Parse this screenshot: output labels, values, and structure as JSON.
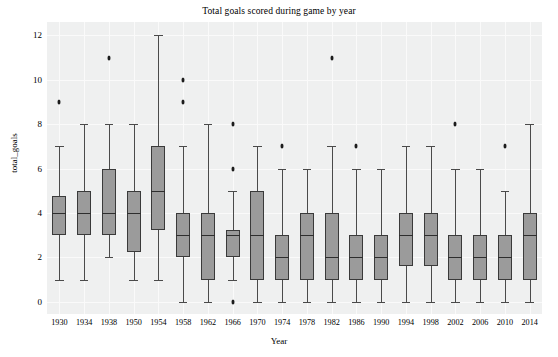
{
  "chart_data": {
    "type": "box",
    "title": "Total goals scored during game by year",
    "xlabel": "Year",
    "ylabel": "total_goals",
    "ylim": [
      -0.55,
      12.6
    ],
    "yticks": [
      0,
      2,
      4,
      6,
      8,
      10,
      12
    ],
    "grid": true,
    "legend": "none",
    "categories": [
      "1930",
      "1934",
      "1938",
      "1950",
      "1954",
      "1958",
      "1962",
      "1966",
      "1970",
      "1974",
      "1978",
      "1982",
      "1986",
      "1990",
      "1994",
      "1998",
      "2002",
      "2006",
      "2010",
      "2014"
    ],
    "boxes": [
      {
        "category": "1930",
        "whisker_low": 1,
        "q1": 3,
        "median": 4,
        "q3": 4.75,
        "whisker_high": 7,
        "outliers": [
          9
        ]
      },
      {
        "category": "1934",
        "whisker_low": 1,
        "q1": 3,
        "median": 4,
        "q3": 5,
        "whisker_high": 8,
        "outliers": []
      },
      {
        "category": "1938",
        "whisker_low": 2,
        "q1": 3,
        "median": 4,
        "q3": 6,
        "whisker_high": 8,
        "outliers": [
          11
        ]
      },
      {
        "category": "1950",
        "whisker_low": 1,
        "q1": 2.25,
        "median": 4,
        "q3": 5,
        "whisker_high": 8,
        "outliers": []
      },
      {
        "category": "1954",
        "whisker_low": 1,
        "q1": 3.25,
        "median": 5,
        "q3": 7,
        "whisker_high": 12,
        "outliers": []
      },
      {
        "category": "1958",
        "whisker_low": 0,
        "q1": 2,
        "median": 3,
        "q3": 4,
        "whisker_high": 7,
        "outliers": [
          9,
          10
        ]
      },
      {
        "category": "1962",
        "whisker_low": 0,
        "q1": 1,
        "median": 3,
        "q3": 4,
        "whisker_high": 8,
        "outliers": []
      },
      {
        "category": "1966",
        "whisker_low": 1,
        "q1": 2,
        "median": 3,
        "q3": 3.25,
        "whisker_high": 5,
        "outliers": [
          0,
          6,
          8
        ]
      },
      {
        "category": "1970",
        "whisker_low": 0,
        "q1": 1,
        "median": 3,
        "q3": 5,
        "whisker_high": 7,
        "outliers": []
      },
      {
        "category": "1974",
        "whisker_low": 0,
        "q1": 1,
        "median": 2,
        "q3": 3,
        "whisker_high": 6,
        "outliers": [
          7
        ]
      },
      {
        "category": "1978",
        "whisker_low": 0,
        "q1": 1,
        "median": 3,
        "q3": 4,
        "whisker_high": 6,
        "outliers": []
      },
      {
        "category": "1982",
        "whisker_low": 0,
        "q1": 1,
        "median": 2,
        "q3": 4,
        "whisker_high": 7,
        "outliers": [
          11
        ]
      },
      {
        "category": "1986",
        "whisker_low": 0,
        "q1": 1,
        "median": 2,
        "q3": 3,
        "whisker_high": 6,
        "outliers": [
          7
        ]
      },
      {
        "category": "1990",
        "whisker_low": 0,
        "q1": 1,
        "median": 2,
        "q3": 3,
        "whisker_high": 6,
        "outliers": []
      },
      {
        "category": "1994",
        "whisker_low": 0,
        "q1": 1.6,
        "median": 3,
        "q3": 4,
        "whisker_high": 7,
        "outliers": []
      },
      {
        "category": "1998",
        "whisker_low": 0,
        "q1": 1.6,
        "median": 3,
        "q3": 4,
        "whisker_high": 7,
        "outliers": []
      },
      {
        "category": "2002",
        "whisker_low": 0,
        "q1": 1,
        "median": 2,
        "q3": 3,
        "whisker_high": 6,
        "outliers": [
          8
        ]
      },
      {
        "category": "2006",
        "whisker_low": 0,
        "q1": 1,
        "median": 2,
        "q3": 3,
        "whisker_high": 6,
        "outliers": []
      },
      {
        "category": "2010",
        "whisker_low": 0,
        "q1": 1,
        "median": 2,
        "q3": 3,
        "whisker_high": 5,
        "outliers": [
          7
        ]
      },
      {
        "category": "2014",
        "whisker_low": 0,
        "q1": 1,
        "median": 3,
        "q3": 4,
        "whisker_high": 8,
        "outliers": []
      }
    ],
    "colors": {
      "box_fill": "#9b9b9b",
      "box_edge": "#3a3a3a",
      "median": "#2e2e2e",
      "whisker": "#4a4a4a",
      "outlier": "#1c1c1c",
      "plot_background": "#eff0f0",
      "gridline": "#fafafa",
      "figure_background": "#ffffff"
    }
  }
}
